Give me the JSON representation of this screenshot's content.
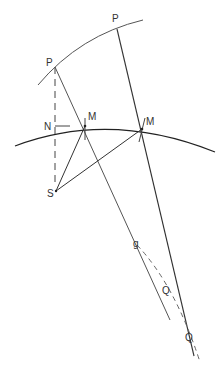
{
  "diagram": {
    "labels": {
      "p1": "P",
      "p2": "P",
      "n": "N",
      "m1": "M",
      "m2": "M",
      "s": "S",
      "g": "g",
      "q1": "Q",
      "q2": "Q"
    },
    "colors": {
      "line": "#333333",
      "background": "#ffffff"
    }
  }
}
